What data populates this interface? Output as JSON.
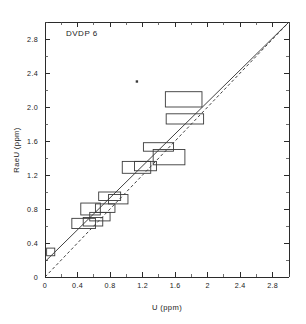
{
  "figure": {
    "annotation": "DVDP 6",
    "background_color": "#ffffff",
    "line_color": "#2b2b2b",
    "box_color": "#3a3a3a"
  },
  "chart_data": {
    "type": "scatter",
    "title": "DVDP 6",
    "xlabel": "U (ppm)",
    "ylabel": "RaeU (ppm)",
    "xlim": [
      0,
      3.0
    ],
    "ylim": [
      0,
      3.0
    ],
    "grid": false,
    "legend": "none",
    "xticks": [
      "0",
      "0.4",
      "0.8",
      "1.2",
      "1.6",
      "2",
      "2.4",
      "2.8"
    ],
    "xtick_values": [
      0,
      0.4,
      0.8,
      1.2,
      1.6,
      2.0,
      2.4,
      2.8
    ],
    "yticks": [
      "0",
      "0.4",
      "0.8",
      "1.2",
      "1.6",
      "2.0",
      "2.4",
      "2.8"
    ],
    "ytick_values": [
      0,
      0.4,
      0.8,
      1.2,
      1.6,
      2.0,
      2.4,
      2.8
    ],
    "minor_tick_step": 0.2,
    "boxes": [
      {
        "x0": 0.02,
        "x1": 0.12,
        "y0": 0.25,
        "y1": 0.34
      },
      {
        "x0": 0.33,
        "x1": 0.62,
        "y0": 0.57,
        "y1": 0.69
      },
      {
        "x0": 0.44,
        "x1": 0.68,
        "y0": 0.73,
        "y1": 0.87
      },
      {
        "x0": 0.47,
        "x1": 0.71,
        "y0": 0.6,
        "y1": 0.7
      },
      {
        "x0": 0.55,
        "x1": 0.8,
        "y0": 0.66,
        "y1": 0.76
      },
      {
        "x0": 0.62,
        "x1": 0.86,
        "y0": 0.76,
        "y1": 0.86
      },
      {
        "x0": 0.66,
        "x1": 0.93,
        "y0": 0.9,
        "y1": 1.0
      },
      {
        "x0": 0.78,
        "x1": 1.02,
        "y0": 0.86,
        "y1": 0.97
      },
      {
        "x0": 0.95,
        "x1": 1.3,
        "y0": 1.22,
        "y1": 1.36
      },
      {
        "x0": 1.1,
        "x1": 1.37,
        "y0": 1.25,
        "y1": 1.36
      },
      {
        "x0": 1.21,
        "x1": 1.58,
        "y0": 1.48,
        "y1": 1.58
      },
      {
        "x0": 1.33,
        "x1": 1.72,
        "y0": 1.32,
        "y1": 1.5
      },
      {
        "x0": 1.49,
        "x1": 1.95,
        "y0": 1.8,
        "y1": 1.92
      },
      {
        "x0": 1.48,
        "x1": 1.93,
        "y0": 2.0,
        "y1": 2.18
      }
    ],
    "points": [
      {
        "x": 1.13,
        "y": 2.3
      }
    ],
    "lines": [
      {
        "name": "regression-line",
        "style": "solid",
        "x0": 0.0,
        "y0": 0.18,
        "x1": 3.0,
        "y1": 3.0
      },
      {
        "name": "one-to-one-line",
        "style": "dashed",
        "x0": 0.0,
        "y0": 0.0,
        "x1": 3.0,
        "y1": 3.0
      }
    ]
  }
}
